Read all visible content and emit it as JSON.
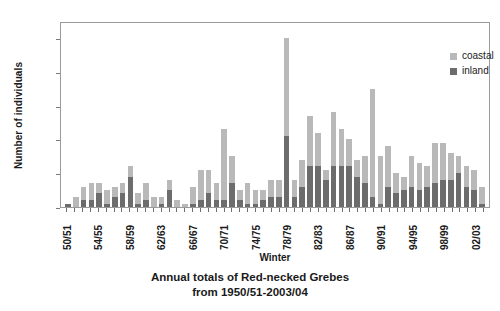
{
  "chart_data": {
    "type": "bar",
    "title": "Annual totals of Red-necked Grebes",
    "subtitle": "from 1950/51-2003/04",
    "xlabel": "Winter",
    "ylabel": "Number of individuals",
    "ylim": [
      0,
      55
    ],
    "yticks": [
      0,
      10,
      20,
      30,
      40,
      50
    ],
    "grid": false,
    "stacked": true,
    "legend_position": "top-right",
    "legend": [
      "coastal",
      "inland"
    ],
    "colors": {
      "coastal": "#b9b9b9",
      "inland": "#6c6c6c"
    },
    "categories": [
      "50/51",
      "51/52",
      "52/53",
      "53/54",
      "54/55",
      "55/56",
      "56/57",
      "57/58",
      "58/59",
      "59/60",
      "60/61",
      "61/62",
      "62/63",
      "63/64",
      "64/65",
      "65/66",
      "66/67",
      "67/68",
      "68/69",
      "69/70",
      "70/71",
      "71/72",
      "72/73",
      "73/74",
      "74/75",
      "75/76",
      "76/77",
      "77/78",
      "78/79",
      "79/80",
      "80/81",
      "81/82",
      "82/83",
      "83/84",
      "84/85",
      "85/86",
      "86/87",
      "87/88",
      "88/89",
      "89/90",
      "90/91",
      "91/92",
      "92/93",
      "93/94",
      "94/95",
      "95/96",
      "96/97",
      "97/98",
      "98/99",
      "99/00",
      "00/01",
      "01/02",
      "02/03",
      "03/04"
    ],
    "xtick_labels": [
      "50/51",
      "54/55",
      "58/59",
      "62/63",
      "66/67",
      "70/71",
      "74/75",
      "78/79",
      "82/83",
      "86/87",
      "90/91",
      "94/95",
      "98/99",
      "02/03"
    ],
    "xtick_every": 4,
    "series": [
      {
        "name": "inland",
        "values": [
          1,
          0,
          2,
          2,
          4,
          1,
          3,
          4,
          9,
          1,
          2,
          0,
          1,
          5,
          0,
          0,
          1,
          2,
          4,
          2,
          2,
          7,
          2,
          1,
          1,
          2,
          3,
          3,
          21,
          3,
          6,
          12,
          12,
          8,
          12,
          12,
          12,
          9,
          7,
          3,
          1,
          6,
          4,
          5,
          6,
          5,
          6,
          7,
          8,
          8,
          10,
          6,
          5,
          1
        ]
      },
      {
        "name": "coastal",
        "values": [
          0,
          3,
          4,
          5,
          3,
          4,
          3,
          3,
          3,
          3,
          5,
          3,
          2,
          3,
          2,
          1,
          5,
          9,
          7,
          5,
          21,
          8,
          3,
          6,
          4,
          3,
          5,
          5,
          29,
          5,
          8,
          15,
          10,
          3,
          16,
          11,
          8,
          5,
          8,
          32,
          14,
          12,
          6,
          4,
          9,
          8,
          6,
          12,
          11,
          8,
          5,
          6,
          6,
          5
        ]
      }
    ],
    "totals": [
      1,
      3,
      6,
      7,
      7,
      5,
      6,
      7,
      12,
      4,
      7,
      3,
      3,
      8,
      2,
      1,
      6,
      11,
      11,
      7,
      23,
      15,
      5,
      7,
      5,
      5,
      8,
      8,
      50,
      8,
      14,
      27,
      22,
      11,
      28,
      23,
      20,
      14,
      15,
      35,
      15,
      18,
      10,
      9,
      15,
      13,
      12,
      19,
      19,
      16,
      15,
      12,
      11,
      6
    ]
  }
}
